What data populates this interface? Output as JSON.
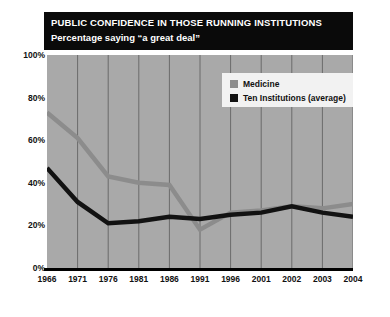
{
  "title": {
    "main": "PUBLIC CONFIDENCE IN THOSE RUNNING INSTITUTIONS",
    "sub": "Percentage saying “a great deal”"
  },
  "legend": {
    "items": [
      {
        "label": "Medicine",
        "color": "#8c8c8c"
      },
      {
        "label": "Ten Institutions (average)",
        "color": "#121212"
      }
    ]
  },
  "colors": {
    "plot_background": "#a9a9a9",
    "gridline": "#6b6b6b",
    "title_background": "#0a0a0a",
    "title_text": "#ffffff",
    "page_background": "#ffffff",
    "medicine": "#8c8c8c",
    "ten_institutions": "#121212",
    "baseline": "#000000",
    "legend_background": "#f2f2f2"
  },
  "chart_data": {
    "type": "line",
    "title": "PUBLIC CONFIDENCE IN THOSE RUNNING INSTITUTIONS",
    "subtitle": "Percentage saying “a great deal”",
    "xlabel": "",
    "ylabel": "",
    "categories": [
      "1966",
      "1971",
      "1976",
      "1981",
      "1986",
      "1991",
      "1996",
      "2001",
      "2002",
      "2003",
      "2004"
    ],
    "ylim": [
      0,
      100
    ],
    "yticks": [
      0,
      20,
      40,
      60,
      80,
      100
    ],
    "ytick_labels": [
      "0%",
      "20%",
      "40%",
      "60%",
      "80%",
      "100%"
    ],
    "grid": "vertical",
    "legend_position": "top-right",
    "series": [
      {
        "name": "Medicine",
        "color": "#8c8c8c",
        "values": [
          73,
          61,
          43,
          40,
          39,
          18,
          26,
          27,
          29,
          28,
          30
        ]
      },
      {
        "name": "Ten Institutions (average)",
        "color": "#121212",
        "values": [
          47,
          31,
          21,
          22,
          24,
          23,
          25,
          26,
          29,
          26,
          24
        ]
      }
    ]
  }
}
